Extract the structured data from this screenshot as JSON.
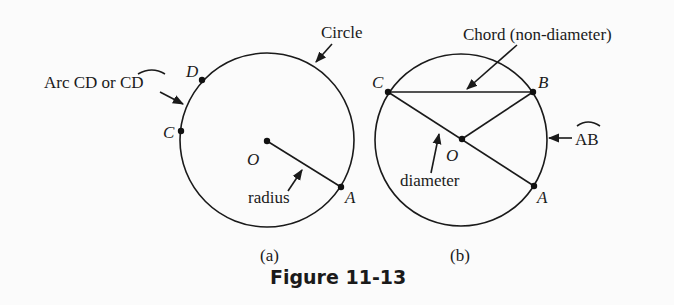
{
  "figure": {
    "caption": "Figure 11-13",
    "panels": [
      {
        "id": "a",
        "sublabel": "(a)",
        "points": {
          "D": "D",
          "C": "C",
          "O": "O",
          "A": "A"
        },
        "labels": {
          "circle": "Circle",
          "arc": "Arc CD or ",
          "arc_symbol": "CD",
          "radius": "radius"
        }
      },
      {
        "id": "b",
        "sublabel": "(b)",
        "points": {
          "C": "C",
          "B": "B",
          "O": "O",
          "A": "A"
        },
        "labels": {
          "chord": "Chord (non-diameter)",
          "diameter": "diameter",
          "arc_symbol": "AB"
        }
      }
    ]
  }
}
